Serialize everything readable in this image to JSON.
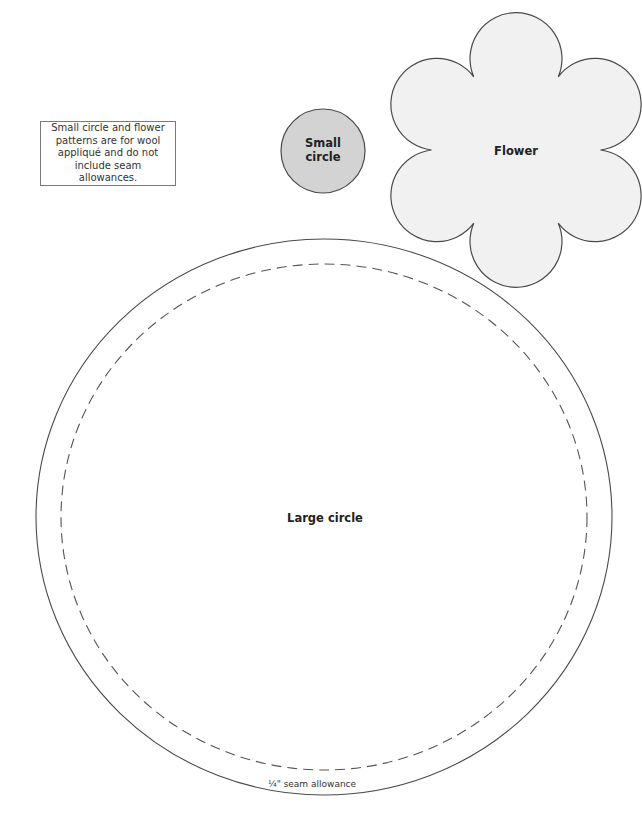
{
  "note": {
    "text": "Small circle and flower patterns are for wool appliqué and do not include seam allowances."
  },
  "small_circle": {
    "label_line1": "Small",
    "label_line2": "circle",
    "fill": "#d3d3d3"
  },
  "flower": {
    "label": "Flower",
    "fill": "#f1f1f1",
    "petals": 6
  },
  "large_circle": {
    "label": "Large circle",
    "seam_label": "¼\" seam allowance"
  },
  "colors": {
    "outline": "#4a4a4a",
    "dashed": "#555555"
  }
}
